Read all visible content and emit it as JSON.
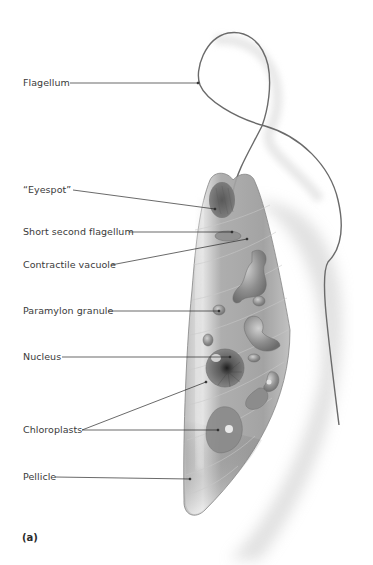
{
  "figure": {
    "panel_label": "(a)",
    "colors": {
      "body_fill": "#a9a9a9",
      "body_dark": "#6f6f6f",
      "body_light": "#d8d8d8",
      "outline": "#7a7a7a",
      "flagellum": "#6a6a6a",
      "leader": "#2a2a2a",
      "text": "#3a3a3a",
      "shadow": "#cfcfcf"
    }
  },
  "labels": [
    {
      "id": "flagellum",
      "text": "Flagellum",
      "x": 23,
      "y": 77
    },
    {
      "id": "eyespot",
      "text": "“Eyespot”",
      "x": 23,
      "y": 184
    },
    {
      "id": "short-second-flagellum",
      "text": "Short second flagellum",
      "x": 23,
      "y": 226
    },
    {
      "id": "contractile-vacuole",
      "text": "Contractile vacuole",
      "x": 23,
      "y": 259
    },
    {
      "id": "paramylon-granule",
      "text": "Paramylon granule",
      "x": 23,
      "y": 306
    },
    {
      "id": "nucleus",
      "text": "Nucleus",
      "x": 23,
      "y": 351
    },
    {
      "id": "chloroplasts",
      "text": "Chloroplasts",
      "x": 23,
      "y": 424
    },
    {
      "id": "pellicle",
      "text": "Pellicle",
      "x": 23,
      "y": 471
    }
  ]
}
